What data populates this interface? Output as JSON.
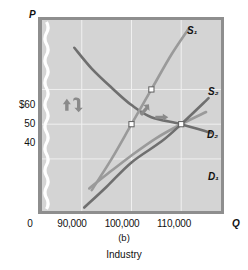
{
  "axes": {
    "y_letter": "P",
    "x_letter": "Q",
    "origin_label": "0"
  },
  "caption": {
    "panel": "(b)",
    "title": "Industry"
  },
  "chart_data": {
    "type": "line",
    "title": "Industry",
    "subtitle": "(b)",
    "xlabel": "Q",
    "ylabel": "P",
    "grid": true,
    "legend_position": "inline-right",
    "axis_break_y": true,
    "xlim": [
      82000,
      118000
    ],
    "ylim": [
      25,
      80
    ],
    "ytick_labels": [
      "$60",
      "50",
      "40"
    ],
    "ytick_values": [
      60,
      50,
      40
    ],
    "xtick_labels": [
      "90,000",
      "100,000",
      "110,000"
    ],
    "xtick_values": [
      90000,
      100000,
      110000
    ],
    "series": [
      {
        "name": "D1",
        "label": "D₁",
        "role": "demand-original",
        "color": "#9a9a9a",
        "points": [
          [
            91500,
            31.5
          ],
          [
            95000,
            35.5
          ],
          [
            100000,
            41.0
          ],
          [
            105000,
            46.0
          ],
          [
            110000,
            50.0
          ],
          [
            115000,
            53.5
          ]
        ]
      },
      {
        "name": "D2",
        "label": "D₂",
        "role": "demand-shifted",
        "color": "#6f6f6f",
        "points": [
          [
            88500,
            72.0
          ],
          [
            92000,
            66.0
          ],
          [
            96000,
            60.5
          ],
          [
            100000,
            55.5
          ],
          [
            104000,
            52.0
          ],
          [
            110000,
            50.0
          ],
          [
            116000,
            47.5
          ]
        ]
      },
      {
        "name": "S1",
        "label": "S₁",
        "role": "supply-original",
        "color": "#9a9a9a",
        "points": [
          [
            92000,
            31.0
          ],
          [
            96000,
            40.0
          ],
          [
            100000,
            50.0
          ],
          [
            104000,
            60.0
          ],
          [
            108000,
            70.0
          ],
          [
            111500,
            77.5
          ]
        ]
      },
      {
        "name": "S2",
        "label": "S₂",
        "role": "supply-shifted",
        "color": "#6f6f6f",
        "points": [
          [
            90500,
            26.0
          ],
          [
            95000,
            32.0
          ],
          [
            100000,
            39.0
          ],
          [
            106000,
            45.0
          ],
          [
            110000,
            50.0
          ],
          [
            115500,
            57.5
          ]
        ]
      }
    ],
    "equilibria": [
      {
        "name": "initial-equilibrium",
        "x": 100000,
        "y": 50,
        "marker": "open-square"
      },
      {
        "name": "intermediate-equilibrium",
        "x": 104000,
        "y": 60,
        "marker": "open-square"
      },
      {
        "name": "final-equilibrium",
        "x": 110000,
        "y": 50,
        "marker": "open-square"
      }
    ],
    "annotations": [
      {
        "name": "price-up-arrow",
        "type": "arrow-up",
        "x": 87000,
        "y": 55
      },
      {
        "name": "price-return-arrow",
        "type": "arrow-curved-down",
        "x": 89000,
        "y": 55
      },
      {
        "name": "equilibrium-shift-up-arrow",
        "type": "arrow-up-right",
        "x": 102500,
        "y": 54
      },
      {
        "name": "equilibrium-shift-right-arrow",
        "type": "arrow-right",
        "x": 106000,
        "y": 52
      }
    ],
    "curve_labels": [
      {
        "series": "S1",
        "text": "S₁"
      },
      {
        "series": "S2",
        "text": "S₂"
      },
      {
        "series": "D2",
        "text": "D₂"
      },
      {
        "series": "D1",
        "text": "D₁"
      }
    ],
    "colors": {
      "plot_background": "#d4d4d4",
      "grid": "#f0f0f0",
      "frame": "#8e8e8e",
      "dark_curve": "#6f6f6f",
      "light_curve": "#9a9a9a",
      "marker_fill": "#ffffff",
      "annotation_arrow": "#8a8a8a"
    }
  }
}
